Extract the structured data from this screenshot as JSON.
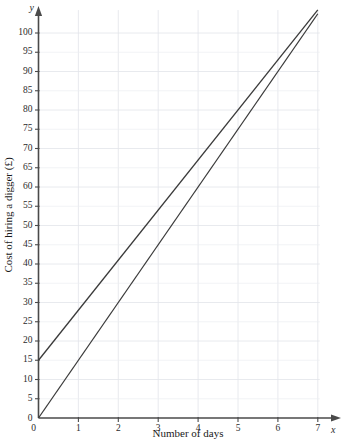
{
  "chart_data": {
    "type": "line",
    "title": "",
    "xlabel": "Number of days",
    "ylabel": "Cost of hiring a digger (£)",
    "x_axis_symbol": "x",
    "y_axis_symbol": "y",
    "xlim": [
      0,
      7.35
    ],
    "ylim": [
      0,
      107
    ],
    "x_ticks": [
      0,
      1,
      2,
      3,
      4,
      5,
      6,
      7
    ],
    "x_tick_labels": [
      "0",
      "1",
      "2",
      "3",
      "4",
      "5",
      "6",
      "7"
    ],
    "y_ticks": [
      0,
      5,
      10,
      15,
      20,
      25,
      30,
      35,
      40,
      45,
      50,
      55,
      60,
      65,
      70,
      75,
      80,
      85,
      90,
      95,
      100
    ],
    "y_tick_labels": [
      "0",
      "5",
      "10",
      "15",
      "20",
      "25",
      "30",
      "35",
      "40",
      "45",
      "50",
      "55",
      "60",
      "65",
      "70",
      "75",
      "80",
      "85",
      "90",
      "95",
      "100"
    ],
    "grid": true,
    "legend": "none",
    "series": [
      {
        "name": "line-through-origin",
        "intercept": 0,
        "slope": 15,
        "points": [
          [
            0,
            0
          ],
          [
            7,
            105
          ]
        ]
      },
      {
        "name": "line-with-fixed-charge",
        "intercept": 15,
        "slope": 13,
        "points": [
          [
            0,
            15
          ],
          [
            7,
            106
          ]
        ]
      }
    ],
    "line_color": "#3a3a3a",
    "grid_color": "#eceef2",
    "axis_color": "#4a4a4a"
  }
}
